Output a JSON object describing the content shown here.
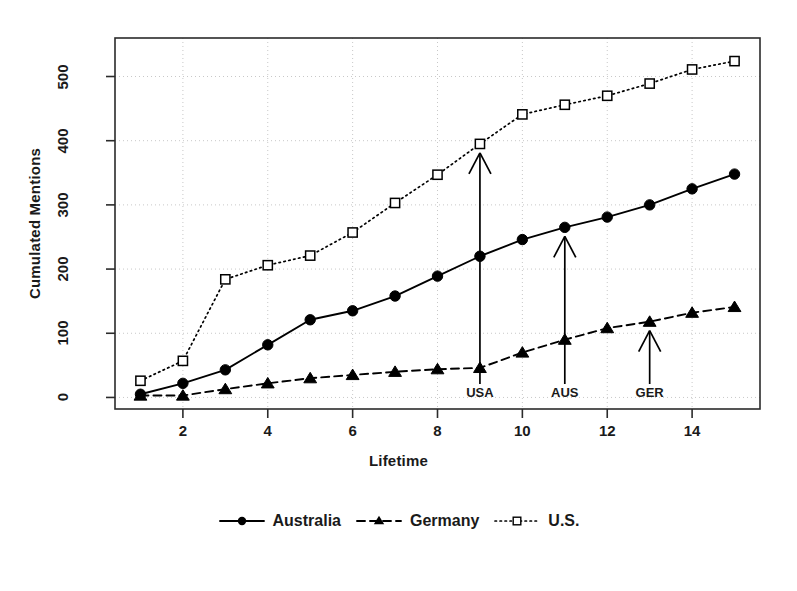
{
  "chart_data": {
    "type": "line",
    "title": "",
    "xlabel": "Lifetime",
    "ylabel": "Cumulated Mentions",
    "x": [
      1,
      2,
      3,
      4,
      5,
      6,
      7,
      8,
      9,
      10,
      11,
      12,
      13,
      14,
      15
    ],
    "xlim": [
      0.4,
      15.6
    ],
    "ylim": [
      -18,
      560
    ],
    "xticks": [
      2,
      4,
      6,
      8,
      10,
      12,
      14
    ],
    "xtick_labels": [
      "2",
      "4",
      "6",
      "8",
      "10",
      "12",
      "14"
    ],
    "yticks": [
      0,
      100,
      200,
      300,
      400,
      500
    ],
    "ytick_labels": [
      "0",
      "100",
      "200",
      "300",
      "400",
      "500"
    ],
    "grid": "dotted both axes",
    "legend_position": "below axes, centered, horizontal",
    "series": [
      {
        "name": "Australia",
        "linestyle": "solid",
        "marker": "filled-circle",
        "color": "#000000",
        "values": [
          5,
          22,
          43,
          82,
          121,
          135,
          158,
          189,
          220,
          246,
          265,
          281,
          300,
          325,
          348
        ]
      },
      {
        "name": "Germany",
        "linestyle": "dashed",
        "marker": "filled-triangle",
        "color": "#000000",
        "values": [
          3,
          3,
          13,
          22,
          30,
          35,
          40,
          44,
          46,
          70,
          90,
          108,
          118,
          132,
          141
        ]
      },
      {
        "name": "U.S.",
        "linestyle": "dotted",
        "marker": "open-square",
        "color": "#000000",
        "values": [
          26,
          57,
          184,
          206,
          221,
          257,
          303,
          347,
          395,
          441,
          456,
          470,
          489,
          511,
          524
        ]
      }
    ],
    "annotations": [
      {
        "label": "USA",
        "x": 9,
        "y": 395,
        "series": "U.S.",
        "style": "upward-arrow"
      },
      {
        "label": "AUS",
        "x": 11,
        "y": 265,
        "series": "Australia",
        "style": "upward-arrow"
      },
      {
        "label": "GER",
        "x": 13,
        "y": 118,
        "series": "Germany",
        "style": "upward-arrow"
      }
    ]
  },
  "legend": {
    "entries": [
      {
        "label": "Australia",
        "key": "solid-line-filled-circle"
      },
      {
        "label": "Germany",
        "key": "dashed-line-filled-triangle"
      },
      {
        "label": "U.S.",
        "key": "dotted-line-open-square"
      }
    ]
  },
  "colors": {
    "foreground": "#1a1a1a",
    "plot_line": "#000000",
    "grid": "#c8c8c8",
    "background": "#ffffff"
  }
}
